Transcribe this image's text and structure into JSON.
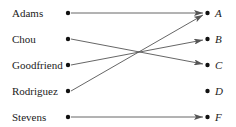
{
  "diagram": {
    "type": "mapping",
    "domain": [
      {
        "label": "Adams",
        "y": 13
      },
      {
        "label": "Chou",
        "y": 39
      },
      {
        "label": "Goodfriend",
        "y": 65
      },
      {
        "label": "Rodriguez",
        "y": 91
      },
      {
        "label": "Stevens",
        "y": 117
      }
    ],
    "codomain": [
      {
        "label": "A",
        "y": 13
      },
      {
        "label": "B",
        "y": 39
      },
      {
        "label": "C",
        "y": 65
      },
      {
        "label": "D",
        "y": 91
      },
      {
        "label": "F",
        "y": 117
      }
    ],
    "arrows": [
      {
        "from": "Adams",
        "to": "A"
      },
      {
        "from": "Chou",
        "to": "C"
      },
      {
        "from": "Goodfriend",
        "to": "B"
      },
      {
        "from": "Rodriguez",
        "to": "A"
      },
      {
        "from": "Stevens",
        "to": "F"
      }
    ],
    "colors": {
      "dot": "#111111",
      "arrow": "#555555",
      "text": "#222222"
    }
  }
}
